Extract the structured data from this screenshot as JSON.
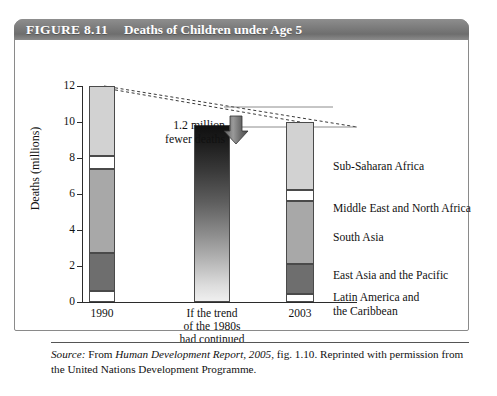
{
  "figure": {
    "number": "FIGURE 8.11",
    "title": "Deaths of Children under Age 5",
    "header_bg": "#7d7d7d",
    "header_text_color": "#ffffff"
  },
  "source": {
    "label": "Source:",
    "text_1": " From ",
    "work": "Human Development Report, 2005",
    "text_2": ", fig. 1.10. Reprinted with permission from the United Nations Development Programme."
  },
  "annotation": {
    "text": "1.2 million\nfewer deaths",
    "arrow": "down-arrow"
  },
  "legend": [
    {
      "name": "Sub-Saharan Africa",
      "color": "#d2d2d2"
    },
    {
      "name": "Middle East and North Africa",
      "color": "#ffffff"
    },
    {
      "name": "South Asia",
      "color": "#a8a8a8"
    },
    {
      "name": "East Asia and the Pacific",
      "color": "#6e6e6e"
    },
    {
      "name": "Latin America and\nthe Caribbean",
      "color": "#ffffff"
    }
  ],
  "chart_data": {
    "type": "bar",
    "title": "Deaths of Children under Age 5",
    "xlabel": "",
    "ylabel": "Deaths (millions)",
    "ylim": [
      0,
      12
    ],
    "yticks": [
      0,
      2,
      4,
      6,
      8,
      10,
      12
    ],
    "ytick_labels": [
      "0",
      "2",
      "4",
      "6",
      "8",
      "10",
      "12"
    ],
    "grid": false,
    "legend_position": "right",
    "stacked": true,
    "categories": [
      "1990",
      "If the trend\nof the 1980s\nhad continued",
      "2003"
    ],
    "series": [
      {
        "name": "Latin America and the Caribbean",
        "color": "#ffffff",
        "values": [
          0.6,
          null,
          0.45
        ]
      },
      {
        "name": "East Asia and the Pacific",
        "color": "#6e6e6e",
        "values": [
          2.1,
          null,
          1.65
        ]
      },
      {
        "name": "South Asia",
        "color": "#a8a8a8",
        "values": [
          4.7,
          null,
          3.5
        ]
      },
      {
        "name": "Middle East and North Africa",
        "color": "#ffffff",
        "values": [
          0.7,
          null,
          0.6
        ]
      },
      {
        "name": "Sub-Saharan Africa",
        "color": "#d2d2d2",
        "values": [
          3.9,
          null,
          3.8
        ]
      }
    ],
    "totals": {
      "1990": 12.0,
      "trend_1980s": 8.95,
      "2003": 10.0
    },
    "annotations": [
      {
        "text": "1.2 million fewer deaths",
        "type": "arrow-callout"
      }
    ],
    "trend_bar": {
      "label": "If the trend of the 1980s had continued",
      "value": 8.95,
      "fill": "gradient-dark-to-light"
    },
    "connector_lines": {
      "style": "dashed",
      "from": "1990 bar top (12)",
      "to": "2003 bar top (10) and arrow"
    }
  },
  "axis": {
    "x_labels": [
      "1990",
      "If the trend\nof the 1980s\nhad continued",
      "2003"
    ]
  }
}
